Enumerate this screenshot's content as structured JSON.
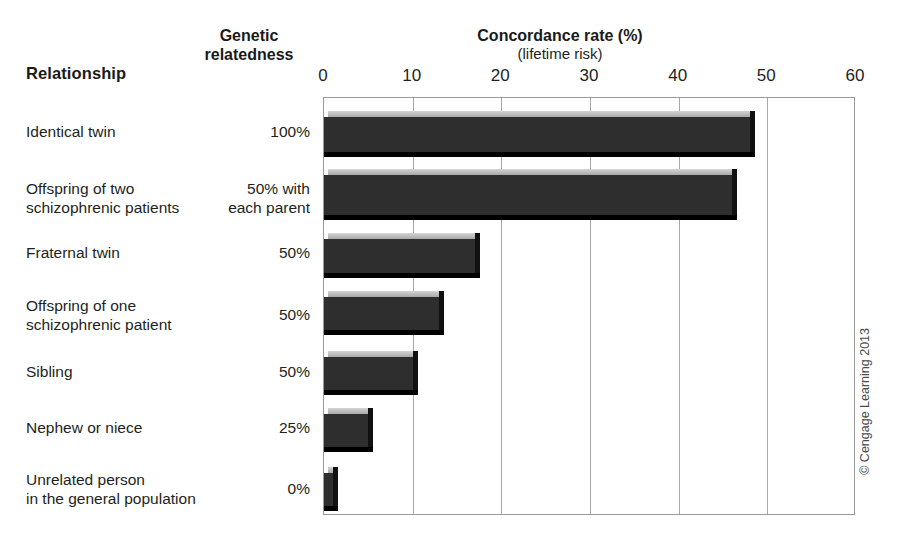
{
  "headers": {
    "relationship": "Relationship",
    "genetic_line1": "Genetic",
    "genetic_line2": "relatedness"
  },
  "chart_title": "Concordance rate (%)",
  "chart_subtitle": "(lifetime risk)",
  "credit": "© Cengage Learning 2013",
  "chart_data": {
    "type": "bar",
    "orientation": "horizontal",
    "title": "Concordance rate (%)",
    "subtitle": "(lifetime risk)",
    "xlabel": "Concordance rate (%)",
    "ylabel": "Relationship",
    "xlim": [
      0,
      60
    ],
    "xticks": [
      0,
      10,
      20,
      30,
      40,
      50,
      60
    ],
    "xtick_labels": [
      "0",
      "10",
      "20",
      "30",
      "40",
      "50",
      "60"
    ],
    "grid": true,
    "grid_axis": "x",
    "legend": false,
    "bar_color": "#2e2e2e",
    "categories": [
      "Identical twin",
      "Offspring of two schizophrenic patients",
      "Fraternal twin",
      "Offspring of one schizophrenic patient",
      "Sibling",
      "Nephew or niece",
      "Unrelated person in the general population"
    ],
    "values": [
      48,
      46,
      17,
      13,
      10,
      5,
      1
    ],
    "genetic_relatedness": [
      "100%",
      "50% with each parent",
      "50%",
      "50%",
      "50%",
      "25%",
      "0%"
    ],
    "rows": [
      {
        "label_lines": [
          "Identical twin"
        ],
        "genetic_lines": [
          "100%"
        ],
        "value": 48,
        "label_top": 122,
        "bar_top": 110,
        "bar_height": 46
      },
      {
        "label_lines": [
          "Offspring of two",
          "schizophrenic patients"
        ],
        "genetic_lines": [
          "50% with",
          "each parent"
        ],
        "value": 46,
        "label_top": 179,
        "bar_top": 168,
        "bar_height": 51
      },
      {
        "label_lines": [
          "Fraternal twin"
        ],
        "genetic_lines": [
          "50%"
        ],
        "value": 17,
        "label_top": 243,
        "bar_top": 232,
        "bar_height": 45
      },
      {
        "label_lines": [
          "Offspring of one",
          "schizophrenic patient"
        ],
        "genetic_lines": [
          "50%"
        ],
        "value": 13,
        "label_top": 296,
        "bar_top": 290,
        "bar_height": 44
      },
      {
        "label_lines": [
          "Sibling"
        ],
        "genetic_lines": [
          "50%"
        ],
        "value": 10,
        "label_top": 362,
        "bar_top": 350,
        "bar_height": 44
      },
      {
        "label_lines": [
          "Nephew or niece"
        ],
        "genetic_lines": [
          "25%"
        ],
        "value": 5,
        "label_top": 418,
        "bar_top": 407,
        "bar_height": 44
      },
      {
        "label_lines": [
          "Unrelated person",
          "in the general population"
        ],
        "genetic_lines": [
          "0%"
        ],
        "value": 1,
        "label_top": 470,
        "bar_top": 466,
        "bar_height": 44
      }
    ]
  }
}
